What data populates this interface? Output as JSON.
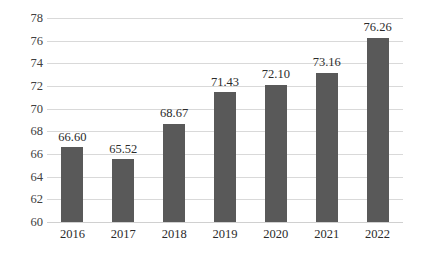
{
  "chart_data": {
    "type": "bar",
    "title": "",
    "xlabel": "",
    "ylabel": "",
    "categories": [
      "2016",
      "2017",
      "2018",
      "2019",
      "2020",
      "2021",
      "2022"
    ],
    "values": [
      66.6,
      65.52,
      68.67,
      71.43,
      72.1,
      73.16,
      76.26
    ],
    "data_labels": [
      "66.60",
      "65.52",
      "68.67",
      "71.43",
      "72.10",
      "73.16",
      "76.26"
    ],
    "ylim": [
      60,
      78
    ],
    "ytick_step": 2,
    "ytick_labels": [
      "78",
      "76",
      "74",
      "72",
      "70",
      "68",
      "66",
      "64",
      "62",
      "60"
    ],
    "ytick_values": [
      78,
      76,
      74,
      72,
      70,
      68,
      66,
      64,
      62,
      60
    ],
    "grid": true,
    "legend": false,
    "legend_position": "none",
    "bar_color": "#595959",
    "grid_color": "#d9d9d9",
    "background_color": "#ffffff",
    "axis_text_color": "#404040"
  }
}
